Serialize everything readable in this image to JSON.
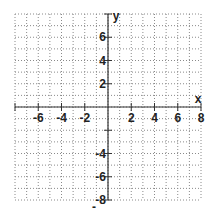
{
  "chart_data": {
    "type": "scatter",
    "title": "",
    "xlabel": "x",
    "ylabel": "y",
    "xlim": [
      -8,
      8
    ],
    "ylim": [
      -8,
      8
    ],
    "grid": true,
    "grid_style": "dotted",
    "grid_step": 1,
    "x_ticks": [
      -6,
      -4,
      -2,
      2,
      4,
      6,
      8
    ],
    "x_tick_labels": [
      "-6",
      "-4",
      "-2",
      "2",
      "4",
      "6",
      "8"
    ],
    "y_ticks": [
      6,
      4,
      2,
      -4,
      -6,
      -8
    ],
    "y_tick_labels": [
      "6",
      "4",
      "2",
      "-4",
      "-6",
      "-8"
    ],
    "series": [],
    "legend": null
  },
  "colors": {
    "background": "#ffffff",
    "grid": "#8a8a8a",
    "axis": "#333333",
    "text": "#222222"
  },
  "axes": {
    "x_name": "x",
    "y_name": "y"
  },
  "footer_mark": "-"
}
